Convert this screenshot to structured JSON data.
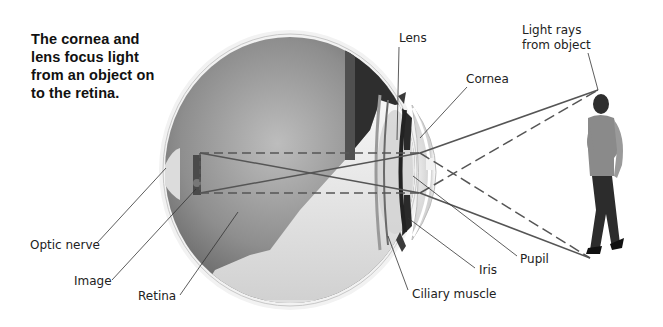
{
  "caption": "The cornea and lens focus light from an object on to the retina.",
  "labels": {
    "lens": "Lens",
    "light_rays": [
      "Light rays",
      "from object"
    ],
    "cornea": "Cornea",
    "optic_nerve": "Optic nerve",
    "image": "Image",
    "retina": "Retina",
    "pupil": "Pupil",
    "iris": "Iris",
    "ciliary_muscle": "Ciliary muscle"
  },
  "colors": {
    "ray": "#555555",
    "leader": "#333333",
    "text": "#222222",
    "eye_dark": "#3a3a3a",
    "eye_mid": "#8f8f8f",
    "eye_light": "#e6e6e6"
  }
}
